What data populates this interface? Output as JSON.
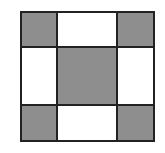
{
  "diagram": {
    "type": "3x3 grid",
    "colors": {
      "shaded": "#8e8e8e",
      "plain": "#ffffff",
      "line": "#222222"
    },
    "cells": [
      [
        "shaded",
        "plain",
        "shaded"
      ],
      [
        "plain",
        "shaded",
        "plain"
      ],
      [
        "shaded",
        "plain",
        "shaded"
      ]
    ]
  }
}
